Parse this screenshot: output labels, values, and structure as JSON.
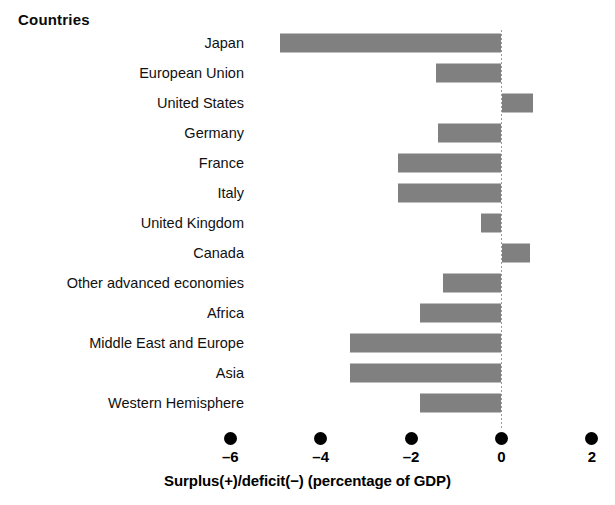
{
  "header": {
    "title": "Countries"
  },
  "axis": {
    "title": "Surplus(+)/deficit(−) (percentage of GDP)",
    "tick_labels": [
      "–6",
      "–4",
      "–2",
      "0",
      "2"
    ],
    "tick_values": [
      -6,
      -4,
      -2,
      0,
      2
    ],
    "bar_color": "#808080",
    "zero_line_color": "#9a9a9a"
  },
  "chart_data": {
    "type": "bar",
    "orientation": "horizontal",
    "title": "Countries",
    "xlabel": "Surplus(+)/deficit(−) (percentage of GDP)",
    "ylabel": "Countries",
    "xlim": [
      -6.8,
      2.5
    ],
    "xticks": [
      -6,
      -4,
      -2,
      0,
      2
    ],
    "xticklabels": [
      "–6",
      "–4",
      "–2",
      "0",
      "2"
    ],
    "grid": false,
    "legend": null,
    "categories": [
      "Japan",
      "European Union",
      "United States",
      "Germany",
      "France",
      "Italy",
      "United Kingdom",
      "Canada",
      "Other advanced economies",
      "Africa",
      "Middle East and Europe",
      "Asia",
      "Western Hemisphere"
    ],
    "values": [
      -4.9,
      -1.45,
      0.7,
      -1.4,
      -2.3,
      -2.3,
      -0.45,
      0.62,
      -1.3,
      -1.8,
      -3.35,
      -3.35,
      -1.8
    ]
  }
}
